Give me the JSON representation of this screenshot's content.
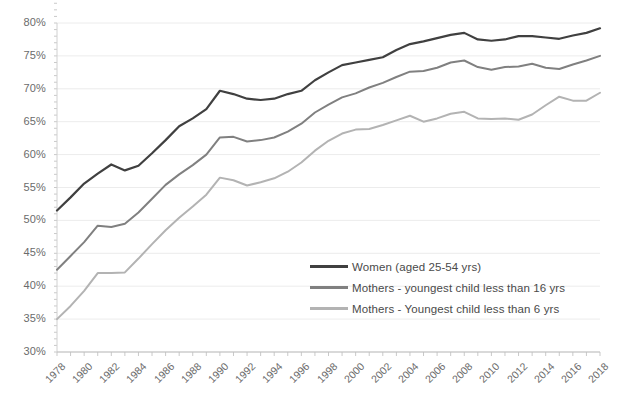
{
  "chart_data": {
    "type": "line",
    "title": "",
    "xlabel": "",
    "ylabel": "",
    "ylim": [
      30,
      85
    ],
    "ytick_step": 5,
    "ytick_labels": [
      "85%",
      "80%",
      "75%",
      "70%",
      "65%",
      "60%",
      "55%",
      "50%",
      "45%",
      "40%",
      "35%",
      "30%"
    ],
    "y_minor_step": 1,
    "grid": true,
    "legend_position": "inside-center-right",
    "xlim": [
      1978,
      2018
    ],
    "x": [
      1978,
      1979,
      1980,
      1981,
      1982,
      1983,
      1984,
      1985,
      1986,
      1987,
      1988,
      1989,
      1990,
      1991,
      1992,
      1993,
      1994,
      1995,
      1996,
      1997,
      1998,
      1999,
      2000,
      2001,
      2002,
      2003,
      2004,
      2005,
      2006,
      2007,
      2008,
      2009,
      2010,
      2011,
      2012,
      2013,
      2014,
      2015,
      2016,
      2017,
      2018
    ],
    "xtick_labels": [
      "1978",
      "1980",
      "1982",
      "1984",
      "1986",
      "1988",
      "1990",
      "1992",
      "1994",
      "1996",
      "1998",
      "2000",
      "2002",
      "2004",
      "2006",
      "2008",
      "2010",
      "2012",
      "2014",
      "2016",
      "2018"
    ],
    "series": [
      {
        "name": "Women (aged 25-54 yrs)",
        "color": "#404040",
        "values": [
          51.5,
          53.5,
          55.6,
          57.1,
          58.5,
          57.6,
          58.3,
          60.2,
          62.2,
          64.3,
          65.5,
          66.9,
          69.7,
          69.2,
          68.5,
          68.3,
          68.5,
          69.2,
          69.7,
          71.3,
          72.5,
          73.6,
          74.0,
          74.4,
          74.8,
          75.9,
          76.8,
          77.2,
          77.7,
          78.2,
          78.5,
          77.5,
          77.3,
          77.5,
          78.0,
          78.0,
          77.8,
          77.6,
          78.1,
          78.5,
          79.2
        ]
      },
      {
        "name": "Mothers - youngest child less than 16 yrs",
        "color": "#808080",
        "values": [
          42.5,
          44.6,
          46.7,
          49.2,
          49.0,
          49.5,
          51.2,
          53.3,
          55.4,
          57.0,
          58.4,
          60.0,
          62.6,
          62.7,
          62.0,
          62.2,
          62.6,
          63.5,
          64.7,
          66.4,
          67.6,
          68.7,
          69.3,
          70.2,
          70.9,
          71.8,
          72.6,
          72.7,
          73.2,
          74.0,
          74.3,
          73.3,
          72.9,
          73.3,
          73.4,
          73.8,
          73.2,
          73.0,
          73.7,
          74.3,
          75.0
        ]
      },
      {
        "name": "Mothers - Youngest child less than 6 yrs",
        "color": "#b3b3b3",
        "values": [
          35.0,
          37.0,
          39.3,
          42.0,
          42.0,
          42.1,
          44.2,
          46.4,
          48.5,
          50.4,
          52.1,
          53.9,
          56.5,
          56.1,
          55.3,
          55.8,
          56.4,
          57.4,
          58.8,
          60.6,
          62.1,
          63.2,
          63.8,
          63.9,
          64.5,
          65.2,
          65.9,
          65.0,
          65.5,
          66.2,
          66.5,
          65.5,
          65.4,
          65.5,
          65.3,
          66.1,
          67.5,
          68.8,
          68.2,
          68.2,
          69.4
        ]
      }
    ]
  }
}
